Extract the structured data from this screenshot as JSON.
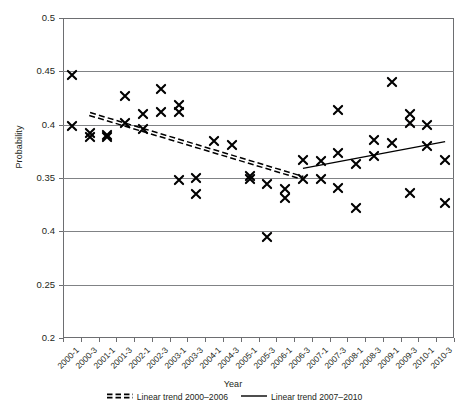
{
  "chart_data": {
    "type": "scatter",
    "title": "",
    "xlabel": "Year",
    "ylabel": "Probability",
    "ylim": [
      0.2,
      0.5
    ],
    "ytick_labels": [
      "0.5",
      "0.45",
      "0.4",
      "0.35",
      "0.4",
      "0.25",
      "0.2"
    ],
    "ytick_values": [
      0.5,
      0.45,
      0.4,
      0.35,
      0.3,
      0.25,
      0.2
    ],
    "grid": true,
    "legend_position": "bottom",
    "categories": [
      "2000-1",
      "2000-3",
      "2001-1",
      "2001-3",
      "2002-1",
      "2002-3",
      "2003-1",
      "2003-3",
      "2004-1",
      "2004-3",
      "2005-1",
      "2005-3",
      "2006-1",
      "2006-3",
      "2007-1",
      "2007-3",
      "2008-1",
      "2008-3",
      "2009-1",
      "2009-3",
      "2010-1",
      "2010-3"
    ],
    "series": [
      {
        "name": "Probability",
        "marker": "x",
        "points": [
          {
            "x": "2000-1",
            "y": 0.399
          },
          {
            "x": "2000-1",
            "y": 0.447
          },
          {
            "x": "2000-3",
            "y": 0.388
          },
          {
            "x": "2000-3",
            "y": 0.392
          },
          {
            "x": "2001-1",
            "y": 0.39
          },
          {
            "x": "2001-1",
            "y": 0.388
          },
          {
            "x": "2001-3",
            "y": 0.427
          },
          {
            "x": "2001-3",
            "y": 0.402
          },
          {
            "x": "2002-1",
            "y": 0.41
          },
          {
            "x": "2002-1",
            "y": 0.396
          },
          {
            "x": "2002-3",
            "y": 0.433
          },
          {
            "x": "2002-3",
            "y": 0.412
          },
          {
            "x": "2003-1",
            "y": 0.418
          },
          {
            "x": "2003-1",
            "y": 0.412
          },
          {
            "x": "2003-1",
            "y": 0.348
          },
          {
            "x": "2003-3",
            "y": 0.35
          },
          {
            "x": "2003-3",
            "y": 0.335
          },
          {
            "x": "2004-1",
            "y": 0.385
          },
          {
            "x": "2004-3",
            "y": 0.381
          },
          {
            "x": "2005-1",
            "y": 0.352
          },
          {
            "x": "2005-1",
            "y": 0.349
          },
          {
            "x": "2005-3",
            "y": 0.295
          },
          {
            "x": "2005-3",
            "y": 0.344
          },
          {
            "x": "2006-1",
            "y": 0.34
          },
          {
            "x": "2006-1",
            "y": 0.331
          },
          {
            "x": "2006-3",
            "y": 0.349
          },
          {
            "x": "2006-3",
            "y": 0.367
          },
          {
            "x": "2007-1",
            "y": 0.366
          },
          {
            "x": "2007-1",
            "y": 0.349
          },
          {
            "x": "2007-3",
            "y": 0.414
          },
          {
            "x": "2007-3",
            "y": 0.341
          },
          {
            "x": "2007-3",
            "y": 0.373
          },
          {
            "x": "2008-1",
            "y": 0.363
          },
          {
            "x": "2008-1",
            "y": 0.322
          },
          {
            "x": "2008-3",
            "y": 0.386
          },
          {
            "x": "2008-3",
            "y": 0.371
          },
          {
            "x": "2009-1",
            "y": 0.44
          },
          {
            "x": "2009-1",
            "y": 0.383
          },
          {
            "x": "2009-3",
            "y": 0.41
          },
          {
            "x": "2009-3",
            "y": 0.402
          },
          {
            "x": "2009-3",
            "y": 0.336
          },
          {
            "x": "2010-1",
            "y": 0.4
          },
          {
            "x": "2010-1",
            "y": 0.38
          },
          {
            "x": "2010-3",
            "y": 0.367
          },
          {
            "x": "2010-3",
            "y": 0.327
          }
        ]
      }
    ],
    "trend_lines": [
      {
        "name": "Linear trend 2000-2006",
        "style": "dashed",
        "x_start": "2000-3",
        "x_end": "2006-3",
        "y_start": 0.41,
        "y_end": 0.35
      },
      {
        "name": "Linear trend 2007-2010",
        "style": "solid",
        "x_start": "2006-3",
        "x_end": "2010-3",
        "y_start": 0.359,
        "y_end": 0.384
      }
    ],
    "legend": [
      {
        "label": "Linear trend 2000–2006",
        "style": "dashed"
      },
      {
        "label": "Linear trend 2007–2010",
        "style": "solid"
      }
    ],
    "colors": {
      "marker": "#000000",
      "trend": "#000000",
      "grid": "#808285",
      "frame": "#6d6e71",
      "text": "#231f20",
      "background": "#ffffff"
    }
  }
}
